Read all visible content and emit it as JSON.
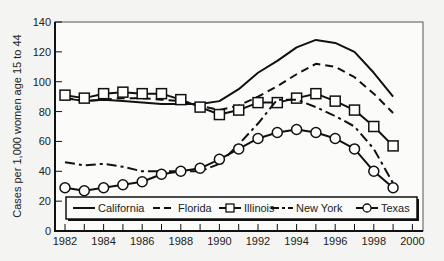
{
  "chart_data": {
    "type": "line",
    "title": "",
    "xlabel": "",
    "ylabel": "Cases per 1,000 women age 15 to 44",
    "xlim": [
      1982,
      2000
    ],
    "ylim": [
      0,
      140
    ],
    "x_ticks": [
      "1982",
      "1984",
      "1986",
      "1988",
      "1990",
      "1992",
      "1994",
      "1996",
      "1998",
      "2000"
    ],
    "y_ticks": [
      "0",
      "20",
      "40",
      "60",
      "80",
      "100",
      "120",
      "140"
    ],
    "grid": false,
    "legend_position": "bottom-inside",
    "x": [
      1982,
      1983,
      1984,
      1985,
      1986,
      1987,
      1988,
      1989,
      1990,
      1991,
      1992,
      1993,
      1994,
      1995,
      1996,
      1997,
      1998,
      1999
    ],
    "series": [
      {
        "name": "California",
        "style": "solid",
        "marker": "none",
        "values": [
          89,
          87,
          88,
          87,
          86,
          85,
          85,
          85,
          87,
          95,
          106,
          114,
          123,
          128,
          126,
          120,
          106,
          90
        ]
      },
      {
        "name": "Florida",
        "style": "dashed",
        "marker": "none",
        "values": [
          89,
          87,
          88,
          89,
          89,
          88,
          87,
          84,
          81,
          84,
          90,
          97,
          105,
          112,
          110,
          103,
          92,
          79
        ]
      },
      {
        "name": "Illinois",
        "style": "solid",
        "marker": "square",
        "values": [
          91,
          89,
          92,
          93,
          92,
          92,
          88,
          83,
          78,
          81,
          86,
          86,
          89,
          92,
          87,
          81,
          70,
          57
        ]
      },
      {
        "name": "New York",
        "style": "dash-dot",
        "marker": "none",
        "values": [
          46,
          44,
          45,
          43,
          40,
          40,
          40,
          40,
          45,
          58,
          72,
          88,
          88,
          83,
          77,
          70,
          55,
          32
        ]
      },
      {
        "name": "Texas",
        "style": "solid",
        "marker": "circle",
        "values": [
          29,
          27,
          29,
          31,
          33,
          38,
          40,
          42,
          48,
          55,
          62,
          66,
          68,
          66,
          62,
          55,
          40,
          29
        ]
      }
    ]
  }
}
